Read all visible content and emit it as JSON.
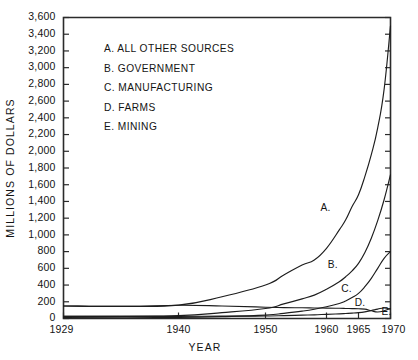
{
  "chart_data": {
    "type": "line",
    "title": "",
    "xlabel": "YEAR",
    "ylabel": "MILLIONS OF DOLLARS",
    "xlim": [
      1929,
      1970
    ],
    "ylim": [
      0,
      3600
    ],
    "grid": false,
    "legend_position": "upper-left-inside",
    "y_ticks": [
      0,
      200,
      400,
      600,
      800,
      1000,
      1200,
      1400,
      1600,
      1800,
      2000,
      2200,
      2400,
      2600,
      2800,
      3000,
      3200,
      3400,
      3600
    ],
    "y_tick_labels": [
      "0",
      "200",
      "400",
      "600",
      "800",
      "1,000",
      "1,200",
      "1,400",
      "1,600",
      "1,800",
      "2,000",
      "2,200",
      "2,400",
      "2,600",
      "2,800",
      "3,000",
      "3,200",
      "3,400",
      "3,600"
    ],
    "x_ticks": [
      1929,
      1940,
      1950,
      1960,
      1965,
      1970
    ],
    "x_tick_labels": [
      "1929",
      "1940",
      "1950",
      "1960",
      "1965",
      "1970"
    ],
    "series": [
      {
        "name": "A",
        "legend_label": "A. ALL OTHER SOURCES",
        "curve_label": "A.",
        "curve_label_x": 1959.0,
        "curve_label_y": 1290,
        "x": [
          1929,
          1935,
          1940,
          1945,
          1950,
          1953,
          1956,
          1958,
          1960,
          1962,
          1963,
          1964,
          1965,
          1966,
          1967,
          1968,
          1969,
          1970
        ],
        "y": [
          150,
          145,
          160,
          260,
          400,
          520,
          640,
          700,
          840,
          1060,
          1180,
          1340,
          1480,
          1700,
          1960,
          2280,
          2740,
          3500
        ]
      },
      {
        "name": "B",
        "legend_label": "B. GOVERNMENT",
        "curve_label": "B.",
        "curve_label_x": 1960.2,
        "curve_label_y": 610,
        "x": [
          1929,
          1935,
          1940,
          1945,
          1950,
          1953,
          1956,
          1958,
          1960,
          1962,
          1963,
          1964,
          1965,
          1966,
          1967,
          1968,
          1969,
          1970
        ],
        "y": [
          25,
          28,
          35,
          70,
          120,
          175,
          235,
          280,
          350,
          440,
          500,
          570,
          660,
          790,
          960,
          1170,
          1420,
          1720
        ]
      },
      {
        "name": "C",
        "legend_label": "C. MANUFACTURING",
        "curve_label": "C.",
        "curve_label_x": 1962.3,
        "curve_label_y": 320,
        "x": [
          1929,
          1935,
          1940,
          1945,
          1950,
          1953,
          1956,
          1958,
          1960,
          1962,
          1963,
          1964,
          1965,
          1966,
          1967,
          1968,
          1969,
          1970
        ],
        "y": [
          10,
          9,
          12,
          22,
          40,
          62,
          88,
          110,
          140,
          180,
          210,
          250,
          300,
          380,
          480,
          600,
          720,
          800
        ]
      },
      {
        "name": "D",
        "legend_label": "D. FARMS",
        "curve_label": "D.",
        "curve_label_x": 1964.4,
        "curve_label_y": 145,
        "x": [
          1929,
          1935,
          1940,
          1945,
          1950,
          1953,
          1956,
          1958,
          1960,
          1962,
          1963,
          1964,
          1965,
          1966,
          1967,
          1968,
          1969,
          1970
        ],
        "y": [
          150,
          145,
          158,
          150,
          135,
          130,
          128,
          126,
          124,
          122,
          120,
          118,
          116,
          112,
          92,
          78,
          92,
          120
        ]
      },
      {
        "name": "E",
        "legend_label": "E. MINING",
        "curve_label": "E.",
        "curve_label_x": 1968.6,
        "curve_label_y": 40,
        "x": [
          1929,
          1935,
          1940,
          1945,
          1950,
          1953,
          1956,
          1958,
          1960,
          1962,
          1963,
          1964,
          1965,
          1966,
          1967,
          1968,
          1969,
          1970
        ],
        "y": [
          25,
          24,
          26,
          28,
          30,
          34,
          40,
          44,
          50,
          56,
          60,
          64,
          70,
          80,
          95,
          112,
          126,
          112
        ]
      }
    ],
    "legend_entries": [
      "A. ALL OTHER SOURCES",
      "B. GOVERNMENT",
      "C. MANUFACTURING",
      "D. FARMS",
      "E. MINING"
    ],
    "colors": {
      "line": "#1d1d1d",
      "axis": "#2b2b2b",
      "text": "#141414",
      "background": "#ffffff"
    }
  }
}
